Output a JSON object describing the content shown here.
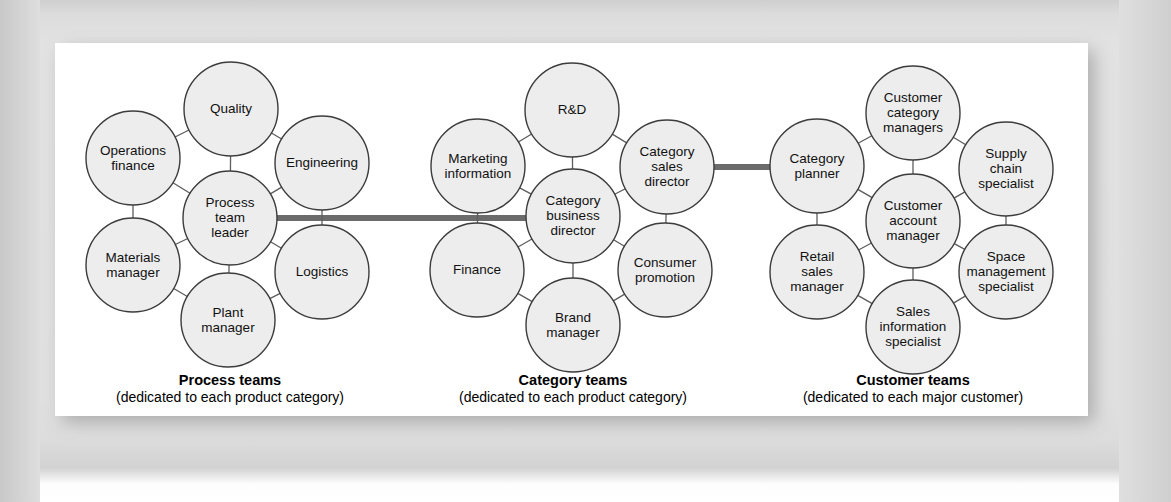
{
  "figure": {
    "colors": {
      "panel_bg": "#ffffff",
      "page_bg": "#dedede",
      "circle_fill": "#ededed",
      "circle_stroke": "#3c3c3c",
      "link_stroke": "#5d5d5d",
      "bar_stroke": "#6b6b6b",
      "text": "#111111"
    },
    "geometry": {
      "node_radius": 47,
      "bar_width": 6
    }
  },
  "clusters": [
    {
      "id": "process-teams",
      "caption_title": "Process teams",
      "caption_sub": "(dedicated to each product category)",
      "caption_x": 230,
      "caption_y": 385,
      "center": {
        "name": "process-team-leader",
        "label": [
          "Process",
          "team",
          "leader"
        ],
        "cx": 230,
        "cy": 218
      },
      "satellites": [
        {
          "name": "quality",
          "label": [
            "Quality"
          ],
          "cx": 231,
          "cy": 109
        },
        {
          "name": "engineering",
          "label": [
            "Engineering"
          ],
          "cx": 322,
          "cy": 163
        },
        {
          "name": "logistics",
          "label": [
            "Logistics"
          ],
          "cx": 322,
          "cy": 272
        },
        {
          "name": "plant-manager",
          "label": [
            "Plant",
            "manager"
          ],
          "cx": 228,
          "cy": 320
        },
        {
          "name": "materials-manager",
          "label": [
            "Materials",
            "manager"
          ],
          "cx": 133,
          "cy": 265
        },
        {
          "name": "operations-finance",
          "label": [
            "Operations",
            "finance"
          ],
          "cx": 133,
          "cy": 158
        }
      ]
    },
    {
      "id": "category-teams",
      "caption_title": "Category teams",
      "caption_sub": "(dedicated to each product category)",
      "caption_x": 573,
      "caption_y": 385,
      "center": {
        "name": "category-business-director",
        "label": [
          "Category",
          "business",
          "director"
        ],
        "cx": 573,
        "cy": 216
      },
      "satellites": [
        {
          "name": "r-and-d",
          "label": [
            "R&D"
          ],
          "cx": 572,
          "cy": 110
        },
        {
          "name": "category-sales-director",
          "label": [
            "Category",
            "sales",
            "director"
          ],
          "cx": 667,
          "cy": 167
        },
        {
          "name": "consumer-promotion",
          "label": [
            "Consumer",
            "promotion"
          ],
          "cx": 665,
          "cy": 270
        },
        {
          "name": "brand-manager",
          "label": [
            "Brand",
            "manager"
          ],
          "cx": 573,
          "cy": 325
        },
        {
          "name": "finance",
          "label": [
            "Finance"
          ],
          "cx": 477,
          "cy": 270
        },
        {
          "name": "marketing-information",
          "label": [
            "Marketing",
            "information"
          ],
          "cx": 478,
          "cy": 166
        }
      ]
    },
    {
      "id": "customer-teams",
      "caption_title": "Customer teams",
      "caption_sub": "(dedicated to each major customer)",
      "caption_x": 913,
      "caption_y": 385,
      "center": {
        "name": "customer-account-manager",
        "label": [
          "Customer",
          "account",
          "manager"
        ],
        "cx": 913,
        "cy": 221
      },
      "satellites": [
        {
          "name": "customer-category-managers",
          "label": [
            "Customer",
            "category",
            "managers"
          ],
          "cx": 913,
          "cy": 113
        },
        {
          "name": "supply-chain-specialist",
          "label": [
            "Supply",
            "chain",
            "specialist"
          ],
          "cx": 1006,
          "cy": 169
        },
        {
          "name": "space-management-specialist",
          "label": [
            "Space",
            "management",
            "specialist"
          ],
          "cx": 1006,
          "cy": 272
        },
        {
          "name": "sales-information-specialist",
          "label": [
            "Sales",
            "information",
            "specialist"
          ],
          "cx": 913,
          "cy": 327
        },
        {
          "name": "retail-sales-manager",
          "label": [
            "Retail",
            "sales",
            "manager"
          ],
          "cx": 817,
          "cy": 272
        },
        {
          "name": "category-planner",
          "label": [
            "Category",
            "planner"
          ],
          "cx": 817,
          "cy": 166
        }
      ]
    }
  ],
  "cluster_links": [
    {
      "name": "process-to-category-bar",
      "x1": 277,
      "y1": 218,
      "x2": 526,
      "y2": 218
    },
    {
      "name": "category-to-customer-bar",
      "x1": 714,
      "y1": 167,
      "x2": 770,
      "y2": 167
    }
  ]
}
